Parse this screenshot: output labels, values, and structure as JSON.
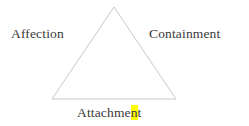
{
  "figure": {
    "type": "triangle-diagram",
    "background_color": "#ffffff",
    "line_color": "#c8c8c8",
    "text_color": "#3a3a3a",
    "highlight_color": "#ffff00"
  },
  "labels": {
    "left": "Affection",
    "right": "Containment",
    "bottom_before_highlight": "Attachme",
    "bottom_highlight": "n",
    "bottom_after_highlight": "t",
    "bottom_full": "Attachment"
  },
  "triangle": {
    "apex": {
      "x": 114,
      "y": 7
    },
    "bottom_left": {
      "x": 52,
      "y": 99
    },
    "bottom_right": {
      "x": 176,
      "y": 99
    }
  }
}
